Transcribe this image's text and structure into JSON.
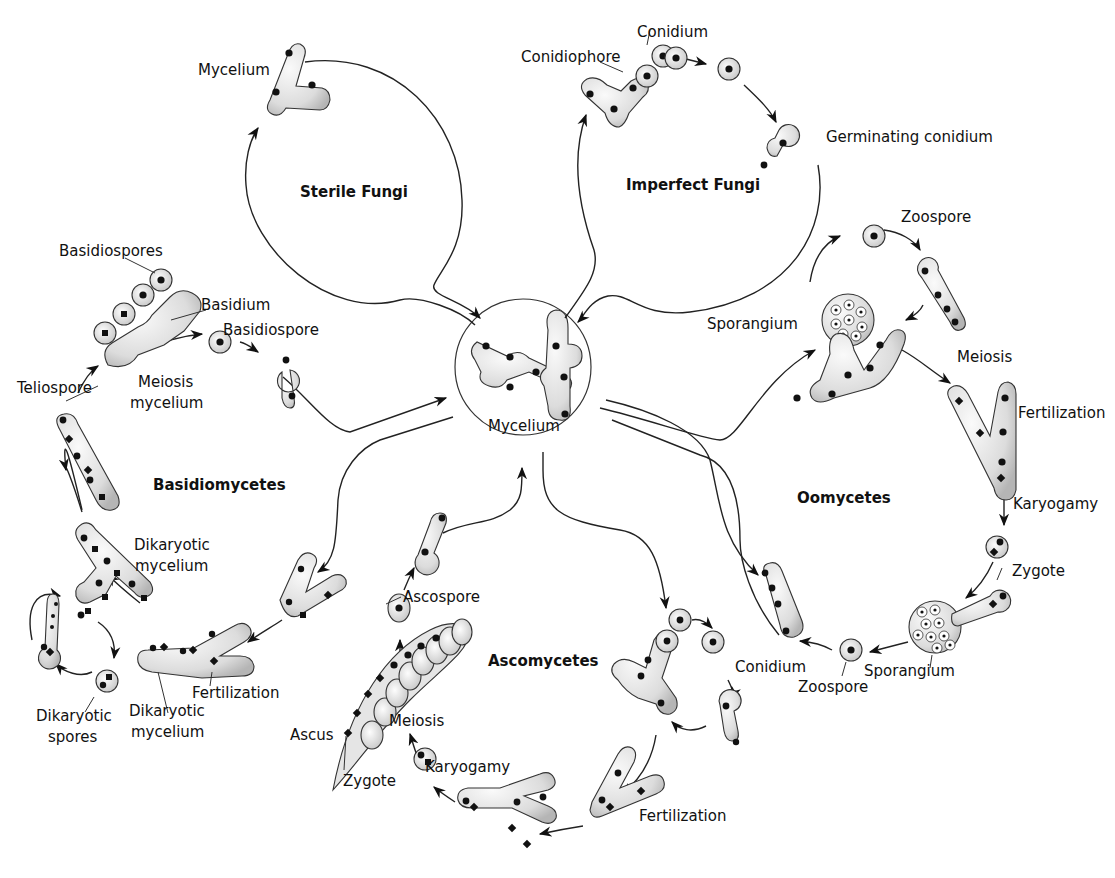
{
  "diagram": {
    "type": "life-cycle",
    "center": {
      "label": "Mycelium"
    },
    "groups": [
      {
        "id": "sterile",
        "title": "Sterile Fungi",
        "labels": [
          "Mycelium"
        ]
      },
      {
        "id": "imperfect",
        "title": "Imperfect Fungi",
        "labels": [
          "Conidium",
          "Conidiophore",
          "Germinating conidium"
        ]
      },
      {
        "id": "oomycetes",
        "title": "Oomycetes",
        "labels": [
          "Zoospore",
          "Sporangium",
          "Meiosis",
          "Fertilization",
          "Karyogamy",
          "Zygote",
          "Sporangium",
          "Zoospore",
          "Conidium"
        ]
      },
      {
        "id": "ascomycetes",
        "title": "Ascomycetes",
        "labels": [
          "Ascospore",
          "Ascus",
          "Meiosis",
          "Zygote",
          "Karyogamy",
          "Fertilization"
        ]
      },
      {
        "id": "basidiomycetes",
        "title": "Basidiomycetes",
        "labels": [
          "Basidiospores",
          "Basidium",
          "Basidiospore",
          "Teliospore",
          "Meiosis mycelium",
          "Dikaryotic mycelium",
          "Dikaryotic spores",
          "Dikaryotic mycelium",
          "Fertilization"
        ]
      }
    ]
  },
  "labels": {
    "center_mycelium": "Mycelium",
    "sterile_title": "Sterile Fungi",
    "sterile_mycelium": "Mycelium",
    "imperfect_title": "Imperfect Fungi",
    "conidium_top": "Conidium",
    "conidiophore": "Conidiophore",
    "germinating_conidium": "Germinating conidium",
    "oomycetes_title": "Oomycetes",
    "oo_zoospore_top": "Zoospore",
    "oo_sporangium_top": "Sporangium",
    "oo_meiosis": "Meiosis",
    "oo_fertilization": "Fertilization",
    "oo_karyogamy": "Karyogamy",
    "oo_zygote": "Zygote",
    "oo_sporangium_bottom": "Sporangium",
    "oo_zoospore_bottom": "Zoospore",
    "oo_conidium": "Conidium",
    "ascomycetes_title": "Ascomycetes",
    "asco_ascospore": "Ascospore",
    "asco_ascus": "Ascus",
    "asco_meiosis": "Meiosis",
    "asco_zygote": "Zygote",
    "asco_karyogamy": "Karyogamy",
    "asco_fertilization": "Fertilization",
    "basidiomycetes_title": "Basidiomycetes",
    "basidiospores": "Basidiospores",
    "basidium": "Basidium",
    "basidiospore": "Basidiospore",
    "teliospore": "Teliospore",
    "meiosis_line1": "Meiosis",
    "meiosis_line2": "mycelium",
    "dik_myc_top_1": "Dikaryotic",
    "dik_myc_top_2": "mycelium",
    "dik_spores_1": "Dikaryotic",
    "dik_spores_2": "spores",
    "dik_myc_bot_1": "Dikaryotic",
    "dik_myc_bot_2": "mycelium",
    "basidio_fertilization": "Fertilization"
  },
  "colors": {
    "line": "#222222",
    "cell_light": "#f4f4f4",
    "cell_dark": "#b8b8b8",
    "nucleus": "#111111"
  }
}
